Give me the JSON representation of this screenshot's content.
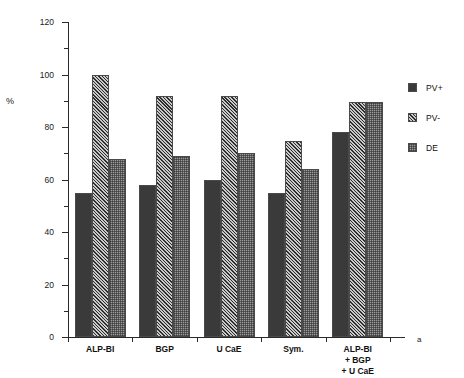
{
  "chart_data": {
    "type": "bar",
    "title": "",
    "xlabel": "",
    "ylabel": "%",
    "ylim": [
      0,
      120
    ],
    "ytick_values": [
      0,
      20,
      40,
      60,
      80,
      100,
      120
    ],
    "ytick_labels": [
      "0",
      "20",
      "40",
      "60",
      "80",
      "100",
      "120"
    ],
    "yminor_values": [
      10,
      30,
      50,
      70,
      90,
      110
    ],
    "grid": false,
    "legend_position": "right",
    "categories": [
      "ALP-BI",
      "BGP",
      "U CaE",
      "Sym.",
      "ALP-BI\n+ BGP\n+ U CaE"
    ],
    "series": [
      {
        "name": "PV+",
        "fill": "solid-dark",
        "color": "#3a3a3a",
        "values": [
          55,
          58,
          60,
          55,
          78
        ]
      },
      {
        "name": "PV-",
        "fill": "diagonal-hatch",
        "color": "#8a8a8a",
        "values": [
          100,
          92,
          92,
          74.5,
          89.5
        ]
      },
      {
        "name": "DE",
        "fill": "dotted-gray",
        "color": "#9a9a9a",
        "values": [
          68,
          69,
          70,
          64,
          89.5
        ]
      }
    ],
    "annotations": [
      {
        "text": "a",
        "position": "bottom-right"
      }
    ]
  },
  "legend": {
    "items": [
      {
        "label": "PV+"
      },
      {
        "label": "PV-"
      },
      {
        "label": "DE"
      }
    ]
  },
  "panel_tag": "a"
}
